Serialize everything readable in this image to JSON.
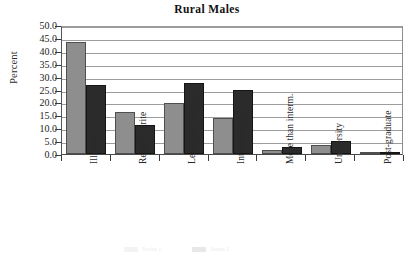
{
  "chart_data": {
    "type": "bar",
    "title": "Rural Males",
    "xlabel": "",
    "ylabel": "Percent",
    "ylim": [
      0.0,
      50.0
    ],
    "ytick_step": 5.0,
    "ytick_labels": [
      "50.0",
      "45.0",
      "40.0",
      "35.0",
      "30.0",
      "25.0",
      "20.0",
      "15.0",
      "10.0",
      "5.0",
      "0.0"
    ],
    "ytick_values": [
      50.0,
      45.0,
      40.0,
      35.0,
      30.0,
      25.0,
      20.0,
      15.0,
      10.0,
      5.0,
      0.0
    ],
    "grid": true,
    "legend_position": "bottom",
    "categories": [
      "Illiterate",
      "Read & write",
      "Less than interm.",
      "Intermediate",
      "More than interm.",
      "University",
      "Post-graduate"
    ],
    "series": [
      {
        "name": "Series 1",
        "color": "#8e8e8e",
        "values": [
          43.5,
          16.3,
          19.9,
          14.0,
          1.4,
          3.6,
          0.3
        ]
      },
      {
        "name": "Series 2",
        "color": "#2b2b2b",
        "values": [
          26.8,
          11.2,
          27.5,
          24.8,
          2.6,
          5.1,
          0.4
        ]
      }
    ]
  }
}
